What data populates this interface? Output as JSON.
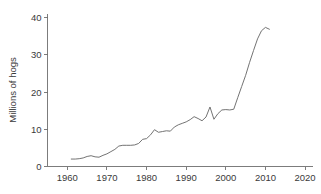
{
  "chart_data": {
    "type": "line",
    "title": "",
    "subtitle": "",
    "xlabel": "",
    "ylabel": "Millions of hogs",
    "xlim": [
      1955,
      2022
    ],
    "ylim": [
      0,
      41
    ],
    "xticks": [
      1960,
      1970,
      1980,
      1990,
      2000,
      2010,
      2020
    ],
    "xtick_labels": [
      "1960",
      "1970",
      "1980",
      "1990",
      "2000",
      "2010",
      "2020"
    ],
    "yticks": [
      0,
      10,
      20,
      30,
      40
    ],
    "ytick_labels": [
      "0",
      "10",
      "20",
      "30",
      "40"
    ],
    "grid": false,
    "legend": null,
    "line_color": "#6b6b6b",
    "axis_color": "#6e6e6e",
    "series": [
      {
        "name": "Millions of hogs",
        "x": [
          1961,
          1962,
          1963,
          1964,
          1965,
          1966,
          1967,
          1968,
          1969,
          1970,
          1971,
          1972,
          1973,
          1974,
          1975,
          1976,
          1977,
          1978,
          1979,
          1980,
          1981,
          1982,
          1983,
          1984,
          1985,
          1986,
          1987,
          1988,
          1989,
          1990,
          1991,
          1992,
          1993,
          1994,
          1995,
          1996,
          1997,
          1998,
          1999,
          2000,
          2001,
          2002,
          2003,
          2004,
          2005,
          2006,
          2007,
          2008,
          2009,
          2010,
          2011
        ],
        "values": [
          2.0,
          2.0,
          2.1,
          2.3,
          2.7,
          2.9,
          2.6,
          2.5,
          3.0,
          3.4,
          4.0,
          4.6,
          5.5,
          5.7,
          5.7,
          5.7,
          5.8,
          6.2,
          7.3,
          7.5,
          8.5,
          9.9,
          9.2,
          9.4,
          9.6,
          9.5,
          10.6,
          11.2,
          11.6,
          12.0,
          12.6,
          13.4,
          12.9,
          12.3,
          13.3,
          16.0,
          12.7,
          14.2,
          15.2,
          15.3,
          15.2,
          15.4,
          18.5,
          21.5,
          24.5,
          28.0,
          31.2,
          34.3,
          36.5,
          37.4,
          36.9
        ]
      }
    ]
  },
  "axes": {
    "y_title": "Millions of hogs"
  }
}
